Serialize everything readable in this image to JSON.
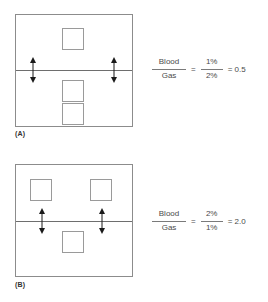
{
  "figure": {
    "panels": [
      {
        "label": "(A)",
        "label_name": "panel-a-label",
        "molecules_above_line": 1,
        "molecules_below_line": 2,
        "arrows": 2,
        "equation": {
          "left_numerator": "Blood",
          "left_denominator": "Gas",
          "equals": "=",
          "right_numerator": "1%",
          "right_denominator": "2%",
          "result": "= 0.5"
        }
      },
      {
        "label": "(B)",
        "label_name": "panel-b-label",
        "molecules_above_line": 2,
        "molecules_below_line": 1,
        "arrows": 2,
        "equation": {
          "left_numerator": "Blood",
          "left_denominator": "Gas",
          "equals": "=",
          "right_numerator": "2%",
          "right_denominator": "1%",
          "result": "= 2.0"
        }
      }
    ],
    "colors": {
      "background": "#ffffff",
      "box_stroke": "#8c8c8c",
      "molecule_stroke": "#9a9a9a",
      "interface_stroke": "#6e6e6e",
      "arrow": "#1a1a1a",
      "text": "#4a4a4a"
    }
  }
}
